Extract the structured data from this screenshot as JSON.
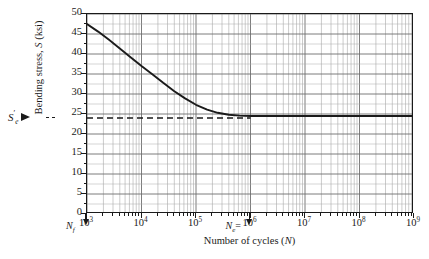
{
  "chart_data": {
    "type": "line",
    "title": "",
    "xlabel": "Number of cycles (N)",
    "ylabel": "Bending stress, S (ksi)",
    "xscale": "log",
    "yscale": "linear",
    "xlim": [
      1000,
      1000000000
    ],
    "ylim": [
      0,
      50
    ],
    "grid": true,
    "legend": false,
    "x_tick_labels": [
      "10",
      "10",
      "10",
      "10",
      "10",
      "10",
      "10"
    ],
    "x_tick_exponents": [
      "3",
      "4",
      "5",
      "6",
      "7",
      "8",
      "9"
    ],
    "x_tick_values": [
      1000,
      10000,
      100000,
      1000000,
      10000000,
      100000000,
      1000000000
    ],
    "y_tick_labels": [
      "0",
      "5",
      "10",
      "15",
      "20",
      "25",
      "30",
      "35",
      "40",
      "45",
      "50"
    ],
    "y_tick_values": [
      0,
      5,
      10,
      15,
      20,
      25,
      30,
      35,
      40,
      45,
      50
    ],
    "series": [
      {
        "name": "S-N curve",
        "style": "solid",
        "color": "#1a1a1a",
        "points": [
          {
            "x": 1000,
            "y": 47.5
          },
          {
            "x": 1600,
            "y": 45.6
          },
          {
            "x": 2500,
            "y": 43.6
          },
          {
            "x": 4000,
            "y": 41.4
          },
          {
            "x": 6300,
            "y": 39.2
          },
          {
            "x": 10000,
            "y": 37.0
          },
          {
            "x": 16000,
            "y": 34.9
          },
          {
            "x": 25000,
            "y": 32.8
          },
          {
            "x": 40000,
            "y": 30.7
          },
          {
            "x": 63000,
            "y": 28.9
          },
          {
            "x": 100000,
            "y": 27.3
          },
          {
            "x": 160000,
            "y": 26.1
          },
          {
            "x": 250000,
            "y": 25.3
          },
          {
            "x": 400000,
            "y": 24.8
          },
          {
            "x": 630000,
            "y": 24.6
          },
          {
            "x": 1000000,
            "y": 24.5
          },
          {
            "x": 10000000,
            "y": 24.5
          },
          {
            "x": 100000000,
            "y": 24.5
          },
          {
            "x": 1000000000,
            "y": 24.5
          }
        ]
      },
      {
        "name": "endurance limit",
        "style": "dashed",
        "color": "#1a1a1a",
        "constant_y": 24.0,
        "x_from": 1000,
        "x_to": 1000000
      }
    ],
    "annotations": [
      {
        "name": "endurance-limit-label",
        "text": "S",
        "sup": "′",
        "sub": "e",
        "y_value": 24.0,
        "arrow": "right"
      },
      {
        "name": "finite-life-start-label",
        "text": "N",
        "sub": "f",
        "x_value": 1000,
        "arrow": "down"
      },
      {
        "name": "endurance-cycles-label",
        "text": "N",
        "sub": "e",
        "x_value": 1000000,
        "arrow": "down",
        "suffix": "="
      }
    ]
  },
  "axes": {
    "y_title_main": "Bending stress, ",
    "y_title_italic": "S",
    "y_title_tail": " (ksi)",
    "x_title_main": "Number of cycles (",
    "x_title_italic": "N",
    "x_title_tail": ")"
  },
  "labels": {
    "se_symbol": "S",
    "se_prime": "′",
    "se_sub": "e",
    "nf_symbol": "N",
    "nf_sub": "f",
    "ne_symbol": "N",
    "ne_sub": "e",
    "ne_equals": "="
  },
  "colors": {
    "curve": "#1a1a1a",
    "grid_major": "#6e6e6e",
    "grid_minor": "#a8a8a8",
    "axis": "#1a1a1a",
    "background": "#ffffff"
  }
}
